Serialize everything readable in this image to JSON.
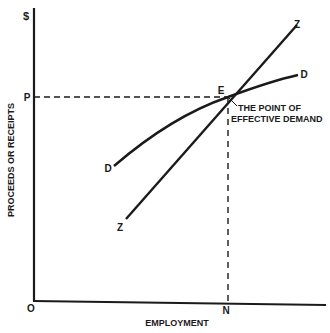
{
  "diagram": {
    "title": "The Point of Effective Demand",
    "y_axis": {
      "unit_label": "$",
      "label": "PROCEEDS OR RECEIPTS",
      "tick_label": "P"
    },
    "x_axis": {
      "label": "EMPLOYMENT",
      "origin_label": "O",
      "tick_label": "N"
    },
    "curves": [
      {
        "name": "aggregate-demand",
        "start_label": "D",
        "end_label": "D"
      },
      {
        "name": "aggregate-supply",
        "start_label": "Z",
        "end_label": "Z"
      }
    ],
    "intersection": {
      "label": "E",
      "annotation_line1": "THE POINT OF",
      "annotation_line2": "EFFECTIVE DEMAND"
    },
    "colors": {
      "ink": "#1a1a1a",
      "background": "#ffffff"
    }
  }
}
